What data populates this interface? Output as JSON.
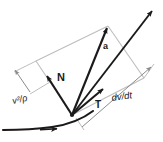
{
  "figure": {
    "background_color": "#ffffff",
    "vector_color": "#1a1a1a",
    "construction_color": "#b9b9b9",
    "path_color": "#1a1a1a",
    "width": 163,
    "height": 142
  },
  "labels": {
    "normal_vector": "N",
    "acceleration_vector": "a",
    "tangent_vector": "T",
    "normal_magnitude": "v²/ρ",
    "tangential_magnitude": "dv/dt"
  },
  "vectors": [
    {
      "name": "acceleration",
      "label": "a",
      "style": "bold",
      "from": [
        72,
        115
      ],
      "to": [
        108,
        26
      ]
    },
    {
      "name": "normal-unit",
      "label": "N",
      "style": "bold",
      "from": [
        72,
        115
      ],
      "to": [
        46,
        74
      ]
    },
    {
      "name": "tangent-unit",
      "label": "T",
      "style": "bold",
      "from": [
        72,
        115
      ],
      "to": [
        104,
        88
      ]
    },
    {
      "name": "tangent-line",
      "label": "",
      "style": "bold",
      "from": [
        72,
        115
      ],
      "to": [
        155,
        8
      ]
    }
  ],
  "parallelogram": {
    "name": "acceleration-parallelogram",
    "points": [
      [
        72,
        115
      ],
      [
        36,
        61
      ],
      [
        108,
        26
      ],
      [
        144,
        78
      ]
    ]
  },
  "dimension_lines": [
    {
      "name": "normal-magnitude-dimension",
      "from": [
        30,
        93
      ],
      "to": [
        12,
        68
      ],
      "label": "v²/ρ"
    },
    {
      "name": "tangential-magnitude-dimension",
      "from": [
        84,
        127
      ],
      "to": [
        152,
        66
      ],
      "label": "dv/dt"
    }
  ],
  "path_curve": {
    "name": "trajectory-curve",
    "description": "particle path through the point",
    "arrow_at": [
      55,
      129
    ]
  }
}
